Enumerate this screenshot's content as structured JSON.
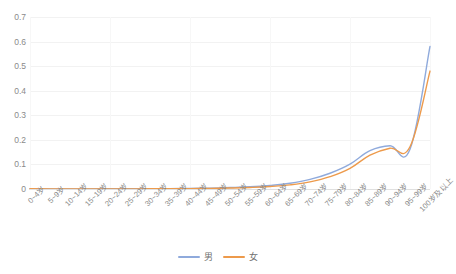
{
  "chart_data": {
    "type": "line",
    "title": "",
    "subtitle": "",
    "xlabel": "",
    "ylabel": "",
    "grid": true,
    "legend_position": "bottom",
    "ylim": [
      0,
      0.7
    ],
    "yticks": [
      "0",
      "0.1",
      "0.2",
      "0.3",
      "0.4",
      "0.5",
      "0.6",
      "0.7"
    ],
    "ytick_values": [
      0,
      0.1,
      0.2,
      0.3,
      0.4,
      0.5,
      0.6,
      0.7
    ],
    "categories": [
      "0~4岁",
      "5~9岁",
      "10~14岁",
      "15~19岁",
      "20~24岁",
      "25~29岁",
      "30~34岁",
      "35~39岁",
      "40~44岁",
      "45~49岁",
      "50~54岁",
      "55~59岁",
      "60~64岁",
      "65~69岁",
      "70~74岁",
      "75~79岁",
      "80~84岁",
      "85~89岁",
      "90~94岁",
      "95~99岁",
      "100岁及以上"
    ],
    "series": [
      {
        "name": "男",
        "color": "#8FAADC",
        "values": [
          0.001,
          0.0004,
          0.0004,
          0.0007,
          0.0009,
          0.001,
          0.0012,
          0.0016,
          0.0024,
          0.0037,
          0.006,
          0.009,
          0.0145,
          0.0235,
          0.039,
          0.064,
          0.101,
          0.156,
          0.176,
          0.162,
          0.58
        ]
      },
      {
        "name": "女",
        "color": "#ED9A4B",
        "values": [
          0.0009,
          0.0003,
          0.0003,
          0.0004,
          0.0005,
          0.0006,
          0.0008,
          0.0011,
          0.0017,
          0.0026,
          0.004,
          0.0062,
          0.01,
          0.0168,
          0.029,
          0.05,
          0.084,
          0.138,
          0.166,
          0.172,
          0.48
        ]
      }
    ]
  },
  "legend": {
    "items": [
      {
        "label": "男",
        "color": "#8FAADC"
      },
      {
        "label": "女",
        "color": "#ED9A4B"
      }
    ]
  }
}
